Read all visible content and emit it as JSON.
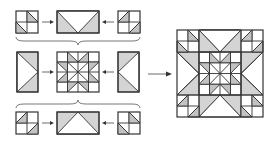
{
  "diagram": {
    "title": "",
    "colors": {
      "background": "#ffffff",
      "outline": "#333333",
      "shaded_fabric": "#d4d4d4",
      "dotted_fabric": "#c2c2c2"
    },
    "rows": [
      {
        "name": "top-row",
        "units": [
          {
            "name": "corner-four-patch-top-left",
            "type": "four-patch with half-square triangles"
          },
          {
            "name": "flying-geese-top",
            "type": "flying geese (point down)"
          },
          {
            "name": "corner-four-patch-top-right",
            "type": "four-patch with half-square triangles"
          }
        ]
      },
      {
        "name": "middle-row",
        "units": [
          {
            "name": "flying-geese-left",
            "type": "flying geese (point right)"
          },
          {
            "name": "center-star",
            "type": "sawtooth star center"
          },
          {
            "name": "flying-geese-right",
            "type": "flying geese (point left)"
          }
        ]
      },
      {
        "name": "bottom-row",
        "units": [
          {
            "name": "corner-four-patch-bottom-left",
            "type": "four-patch with half-square triangles"
          },
          {
            "name": "flying-geese-bottom",
            "type": "flying geese (point up)"
          },
          {
            "name": "corner-four-patch-bottom-right",
            "type": "four-patch with half-square triangles"
          }
        ]
      }
    ],
    "connectors": [
      "row-join braces between rows",
      "arrow to finished block"
    ],
    "result": {
      "name": "finished-block",
      "type": "star-in-star quilt block"
    }
  }
}
